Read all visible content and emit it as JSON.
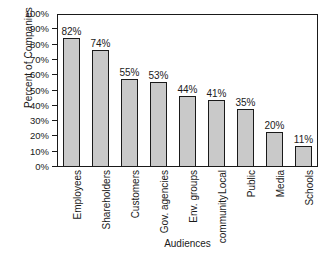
{
  "chart_data": {
    "type": "bar",
    "title": "",
    "xlabel": "Audiences",
    "ylabel": "Percent of Companies",
    "categories": [
      "Employees",
      "Shareholders",
      "Customers",
      "Gov. agencies",
      "Env. groups",
      "Local community",
      "Public",
      "Media",
      "Schools"
    ],
    "category_lines": [
      [
        "Employees"
      ],
      [
        "Shareholders"
      ],
      [
        "Customers"
      ],
      [
        "Gov. agencies"
      ],
      [
        "Env. groups"
      ],
      [
        "Local",
        "community"
      ],
      [
        "Public"
      ],
      [
        "Media"
      ],
      [
        "Schools"
      ]
    ],
    "values": [
      82,
      74,
      55,
      53,
      44,
      41,
      35,
      20,
      11
    ],
    "value_labels": [
      "82%",
      "74%",
      "55%",
      "53%",
      "44%",
      "41%",
      "35%",
      "20%",
      "11%"
    ],
    "ylim": [
      0,
      100
    ],
    "ytick_values": [
      100,
      90,
      80,
      70,
      60,
      50,
      40,
      30,
      20,
      10,
      0
    ],
    "ytick_labels": [
      "100%",
      "90%",
      "80%",
      "70%",
      "60%",
      "50%",
      "40%",
      "30%",
      "20%",
      "10%",
      "0%"
    ],
    "grid": false,
    "legend": false,
    "bar_fill_color": "#c9c9c9",
    "bar_edge_color": "#1a1a1a",
    "background_color": "#ffffff"
  }
}
